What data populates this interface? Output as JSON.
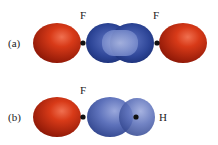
{
  "panels": [
    {
      "id": "a",
      "label": "(a)",
      "atoms": [
        {
          "symbol": "F"
        },
        {
          "symbol": "F"
        }
      ]
    },
    {
      "id": "b",
      "label": "(b)",
      "atoms": [
        {
          "symbol": "F"
        },
        {
          "symbol": "H"
        }
      ]
    }
  ],
  "colors": {
    "lobe_red": "#d42a10",
    "overlap_blue": "#2f4a9a",
    "orbital_blue": "#5a6fb8",
    "nucleus": "#111111"
  }
}
